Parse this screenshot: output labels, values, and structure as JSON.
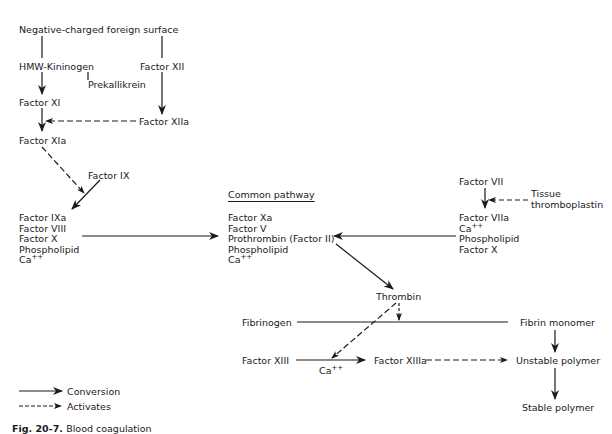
{
  "diagram": {
    "intrinsic": {
      "surface": "Negative-charged foreign surface",
      "hmw_kininogen": "HMW-Kininogen",
      "prekallikrein": "Prekallikrein",
      "factor_xii": "Factor XII",
      "factor_xiia": "Factor XIIa",
      "factor_xi": "Factor XI",
      "factor_xia": "Factor XIa",
      "factor_ix": "Factor IX",
      "complex": [
        "Factor IXa",
        "Factor VIII",
        "Factor X",
        "Phospholipid",
        "Ca++"
      ]
    },
    "common": {
      "header": "Common pathway",
      "complex": [
        "Factor Xa",
        "Factor V",
        "Prothrombin (Factor II)",
        "Phospholipid",
        "Ca++"
      ],
      "thrombin": "Thrombin",
      "fibrinogen": "Fibrinogen",
      "fibrin_monomer": "Fibrin monomer",
      "factor_xiii": "Factor XIII",
      "ca": "Ca++",
      "factor_xiiia": "Factor XIIIa",
      "unstable_polymer": "Unstable polymer",
      "stable_polymer": "Stable polymer"
    },
    "extrinsic": {
      "factor_vii": "Factor VII",
      "tissue_thromboplastin": [
        "Tissue",
        "thromboplastin"
      ],
      "complex": [
        "Factor VIIa",
        "Ca++",
        "Phospholipid",
        "Factor X"
      ]
    },
    "legend": [
      {
        "style": "solid",
        "label": "Conversion"
      },
      {
        "style": "dashed",
        "label": "Activates"
      }
    ],
    "caption": {
      "fig": "Fig. 20-7.",
      "text": "Blood coagulation"
    }
  }
}
